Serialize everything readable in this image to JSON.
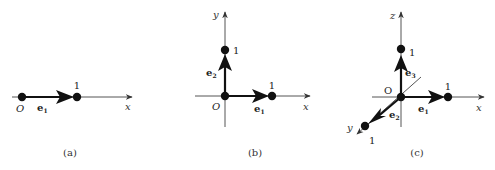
{
  "figure": {
    "panels": [
      {
        "id": "a",
        "caption": "(a)",
        "origin_label": "O",
        "axes": [
          {
            "name": "x",
            "label": "x"
          }
        ],
        "vectors": [
          {
            "name": "e1",
            "base": "e",
            "sub": "1",
            "unit_label": "1"
          }
        ]
      },
      {
        "id": "b",
        "caption": "(b)",
        "origin_label": "O",
        "axes": [
          {
            "name": "x",
            "label": "x"
          },
          {
            "name": "y",
            "label": "y"
          }
        ],
        "vectors": [
          {
            "name": "e1",
            "base": "e",
            "sub": "1",
            "unit_label": "1"
          },
          {
            "name": "e2",
            "base": "e",
            "sub": "2",
            "unit_label": "1"
          }
        ]
      },
      {
        "id": "c",
        "caption": "(c)",
        "origin_label": "O",
        "axes": [
          {
            "name": "x",
            "label": "x"
          },
          {
            "name": "y",
            "label": "y"
          },
          {
            "name": "z",
            "label": "z"
          }
        ],
        "vectors": [
          {
            "name": "e1",
            "base": "e",
            "sub": "1",
            "unit_label": "1"
          },
          {
            "name": "e2",
            "base": "e",
            "sub": "2",
            "unit_label": "1"
          },
          {
            "name": "e3",
            "base": "e",
            "sub": "3",
            "unit_label": "1"
          }
        ]
      }
    ]
  },
  "colors": {
    "ink": "#111111",
    "axis": "#555555",
    "background": "#ffffff"
  }
}
